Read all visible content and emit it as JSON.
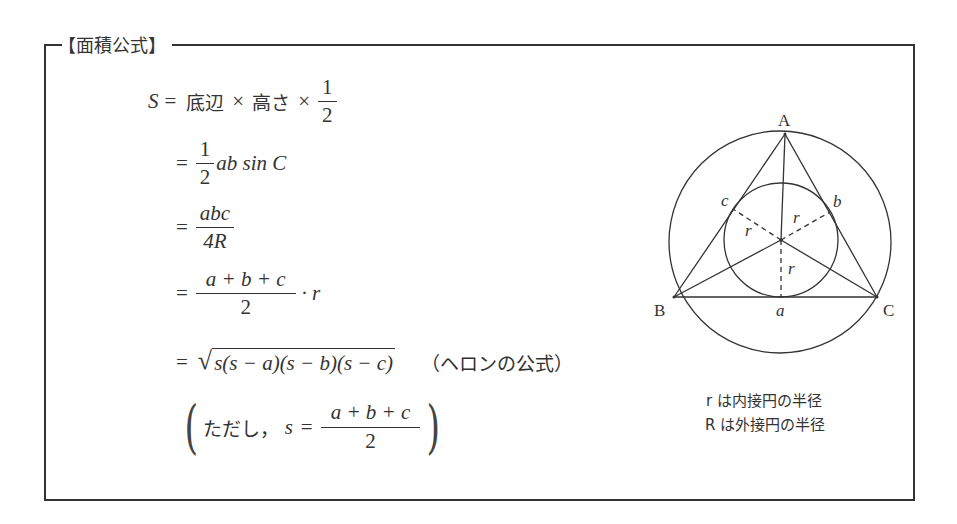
{
  "box": {
    "title": "【面積公式】"
  },
  "formulas": {
    "line1": {
      "lhs": "S",
      "eq": "=",
      "base": "底辺",
      "times1": "×",
      "height": "高さ",
      "times2": "×",
      "frac_num": "1",
      "frac_den": "2"
    },
    "line2": {
      "eq": "=",
      "frac_num": "1",
      "frac_den": "2",
      "rest": "ab sin C"
    },
    "line3": {
      "eq": "=",
      "frac_num": "abc",
      "frac_den": "4R"
    },
    "line4": {
      "eq": "=",
      "frac_num": "a + b + c",
      "frac_den": "2",
      "rest": "· r"
    },
    "line5": {
      "eq": "=",
      "radical": "√",
      "radicand": "s(s − a)(s − b)(s − c)",
      "note": "（ヘロンの公式）"
    },
    "line6": {
      "open_paren": "(",
      "prefix": "ただし，",
      "var": "s",
      "eq": "=",
      "frac_num": "a + b + c",
      "frac_den": "2",
      "close_paren": ")"
    }
  },
  "diagram": {
    "vertex_labels": {
      "A": "A",
      "B": "B",
      "C": "C"
    },
    "side_labels": {
      "a": "a",
      "b": "b",
      "c": "c"
    },
    "radius_labels": [
      "r",
      "r",
      "r"
    ],
    "colors": {
      "stroke": "#333333"
    }
  },
  "captions": {
    "inradius": "r は内接円の半径",
    "circumradius": "R は外接円の半径"
  }
}
